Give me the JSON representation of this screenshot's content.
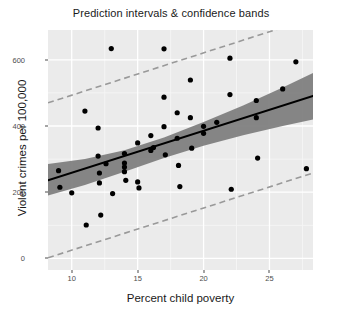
{
  "chart_data": {
    "type": "scatter",
    "title": "Prediction intervals & confidence bands",
    "xlabel": "Percent child poverty",
    "ylabel": "Violent crimes per 100,000",
    "xlim": [
      8.2,
      28.3
    ],
    "ylim": [
      -35,
      690
    ],
    "xticks": [
      10,
      15,
      20,
      25
    ],
    "yticks": [
      0,
      200,
      400,
      600
    ],
    "grid": true,
    "legend": "none",
    "points": [
      {
        "x": 9.0,
        "y": 265
      },
      {
        "x": 9.1,
        "y": 215
      },
      {
        "x": 10.0,
        "y": 198
      },
      {
        "x": 11.0,
        "y": 445
      },
      {
        "x": 11.1,
        "y": 101
      },
      {
        "x": 12.0,
        "y": 394
      },
      {
        "x": 12.0,
        "y": 309
      },
      {
        "x": 12.1,
        "y": 258
      },
      {
        "x": 12.1,
        "y": 228
      },
      {
        "x": 12.2,
        "y": 131
      },
      {
        "x": 12.6,
        "y": 286
      },
      {
        "x": 13.0,
        "y": 634
      },
      {
        "x": 13.1,
        "y": 196
      },
      {
        "x": 14.0,
        "y": 317
      },
      {
        "x": 14.0,
        "y": 288
      },
      {
        "x": 14.0,
        "y": 276
      },
      {
        "x": 14.0,
        "y": 262
      },
      {
        "x": 14.1,
        "y": 236
      },
      {
        "x": 15.0,
        "y": 349
      },
      {
        "x": 15.0,
        "y": 231
      },
      {
        "x": 15.1,
        "y": 213
      },
      {
        "x": 16.0,
        "y": 371
      },
      {
        "x": 16.0,
        "y": 326
      },
      {
        "x": 16.2,
        "y": 335
      },
      {
        "x": 17.0,
        "y": 633
      },
      {
        "x": 17.0,
        "y": 487
      },
      {
        "x": 17.0,
        "y": 398
      },
      {
        "x": 17.1,
        "y": 313
      },
      {
        "x": 18.0,
        "y": 440
      },
      {
        "x": 18.0,
        "y": 363
      },
      {
        "x": 18.1,
        "y": 281
      },
      {
        "x": 18.2,
        "y": 217
      },
      {
        "x": 19.0,
        "y": 539
      },
      {
        "x": 19.0,
        "y": 425
      },
      {
        "x": 19.1,
        "y": 333
      },
      {
        "x": 20.0,
        "y": 399
      },
      {
        "x": 20.0,
        "y": 378
      },
      {
        "x": 21.0,
        "y": 411
      },
      {
        "x": 22.0,
        "y": 605
      },
      {
        "x": 22.0,
        "y": 495
      },
      {
        "x": 22.1,
        "y": 209
      },
      {
        "x": 24.0,
        "y": 477
      },
      {
        "x": 24.0,
        "y": 425
      },
      {
        "x": 24.1,
        "y": 303
      },
      {
        "x": 26.0,
        "y": 512
      },
      {
        "x": 27.0,
        "y": 594
      },
      {
        "x": 27.8,
        "y": 271
      }
    ],
    "fit_line": {
      "name": "regression-line",
      "x": [
        8.2,
        28.3
      ],
      "y": [
        236,
        491
      ],
      "style": "solid",
      "color": "#000000"
    },
    "confidence_band": {
      "name": "confidence-band",
      "x": [
        8.2,
        11.0,
        14.0,
        17.0,
        20.0,
        23.0,
        26.0,
        28.3
      ],
      "upper": [
        285,
        300,
        327,
        365,
        412,
        462,
        516,
        560
      ],
      "lower": [
        190,
        222,
        262,
        303,
        340,
        372,
        400,
        420
      ],
      "color": "#7f7f7f"
    },
    "prediction_upper": {
      "name": "prediction-interval-upper",
      "x": [
        8.2,
        28.3
      ],
      "y": [
        470,
        727
      ],
      "style": "dashed",
      "color": "#999999"
    },
    "prediction_lower": {
      "name": "prediction-interval-lower",
      "x": [
        8.2,
        28.3
      ],
      "y": [
        2,
        258
      ],
      "style": "dashed",
      "color": "#999999"
    },
    "colors": {
      "panel_background": "#ebebeb",
      "grid_major": "#ffffff",
      "grid_minor": "#f5f5f5",
      "point": "#000000",
      "fit": "#000000",
      "band": "#7f7f7f",
      "prediction": "#999999",
      "text": "#1a1a1a",
      "tick_text": "#4d4d4d"
    }
  }
}
